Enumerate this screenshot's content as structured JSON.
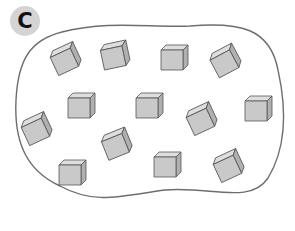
{
  "label": "C",
  "colors": {
    "badge_bg": "#d4d4d4",
    "outline": "#6e6e6e",
    "cube_front": "#c9c9c9",
    "cube_top": "#dedede",
    "cube_side": "#b0b0b0",
    "cube_edge": "#555555"
  },
  "region": {
    "shape": "blob",
    "count_of_cubes": 13
  },
  "cubes": [
    {
      "x": 64,
      "y": 61,
      "rot": -25
    },
    {
      "x": 113,
      "y": 57,
      "rot": -12
    },
    {
      "x": 172,
      "y": 59,
      "rot": 0
    },
    {
      "x": 224,
      "y": 63,
      "rot": -28
    },
    {
      "x": 79,
      "y": 107,
      "rot": 0
    },
    {
      "x": 147,
      "y": 107,
      "rot": 0
    },
    {
      "x": 200,
      "y": 121,
      "rot": -25
    },
    {
      "x": 256,
      "y": 110,
      "rot": 0
    },
    {
      "x": 35,
      "y": 131,
      "rot": -25
    },
    {
      "x": 115,
      "y": 146,
      "rot": -22
    },
    {
      "x": 70,
      "y": 174,
      "rot": 0
    },
    {
      "x": 165,
      "y": 166,
      "rot": 0
    },
    {
      "x": 227,
      "y": 168,
      "rot": -25
    }
  ]
}
